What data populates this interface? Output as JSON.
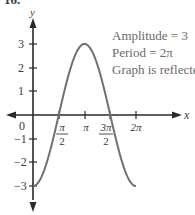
{
  "problem_number": "16.",
  "annotations": [
    "Amplitude = 3",
    "Period = 2π",
    "Graph is reflected"
  ],
  "axes": {
    "x_label": "x",
    "y_label": "y",
    "origin_label": "0",
    "x_ticks": [
      {
        "num": "π",
        "den": "2"
      },
      {
        "num": "π",
        "den": ""
      },
      {
        "num": "3π",
        "den": "2"
      },
      {
        "num": "2π",
        "den": ""
      }
    ],
    "y_ticks": [
      "3",
      "2",
      "1",
      "−1",
      "−2",
      "−3"
    ]
  },
  "chart_data": {
    "type": "line",
    "title": "",
    "function": "y = -3 cos(x)",
    "xlabel": "x",
    "ylabel": "y",
    "xlim": [
      0,
      6.283
    ],
    "ylim": [
      -3,
      3
    ],
    "x_tick_labels": [
      "π/2",
      "π",
      "3π/2",
      "2π"
    ],
    "y_tick_labels": [
      "-3",
      "-2",
      "-1",
      "1",
      "2",
      "3"
    ],
    "series": [
      {
        "name": "y = -3cos x",
        "x": [
          0,
          0.785,
          1.571,
          2.356,
          3.142,
          3.927,
          4.712,
          5.498,
          6.283
        ],
        "values": [
          -3,
          -2.12,
          0,
          2.12,
          3,
          2.12,
          0,
          -2.12,
          -3
        ]
      }
    ],
    "annotations": [
      "Amplitude = 3",
      "Period = 2π",
      "Graph is reflected"
    ],
    "grid": false
  }
}
